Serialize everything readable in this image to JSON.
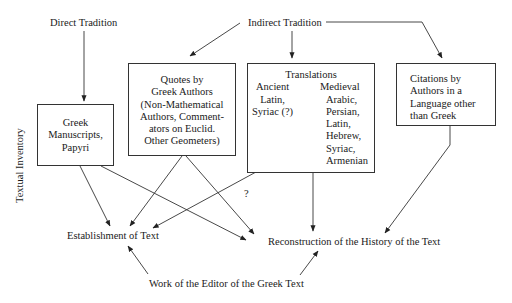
{
  "diagram": {
    "side_label": "Textual Inventory",
    "sources": {
      "direct": "Direct Tradition",
      "indirect": "Indirect Tradition"
    },
    "boxes": {
      "greek_manuscripts": [
        "Greek",
        "Manuscripts,",
        "Papyri"
      ],
      "quotes": [
        "Quotes by",
        "Greek Authors",
        "(Non-Mathematical",
        "Authors, Comment-",
        "ators on Euclid.",
        "Other Geometers)"
      ],
      "translations": {
        "title": "Translations",
        "ancient": [
          "Ancient",
          "Latin,",
          "Syriac (?)"
        ],
        "medieval": [
          "Medieval",
          "Arabic,",
          "Persian,",
          "Latin,",
          "Hebrew,",
          "Syriac,",
          "Armenian"
        ]
      },
      "citations": [
        "Citations by",
        "Authors in a",
        "Language other",
        "than Greek"
      ]
    },
    "outcomes": {
      "establishment": "Establishment of Text",
      "reconstruction": "Reconstruction of the History of the Text",
      "editor_work": "Work of the Editor of the Greek Text"
    },
    "question_mark": "?",
    "colors": {
      "line": "#333333",
      "text": "#1a1a1a",
      "background": "#ffffff"
    }
  }
}
